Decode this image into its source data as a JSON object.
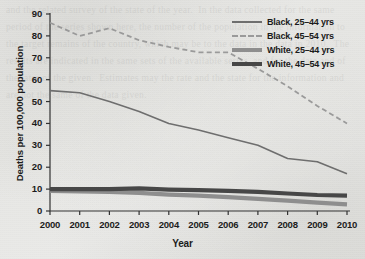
{
  "chart_data": {
    "type": "line",
    "title": "",
    "xlabel": "Year",
    "ylabel": "Deaths per 100,000 population",
    "x": [
      2000,
      2001,
      2002,
      2003,
      2004,
      2005,
      2006,
      2007,
      2008,
      2009,
      2010
    ],
    "xtick_labels": [
      "2000",
      "2001",
      "2002",
      "2003",
      "2004",
      "2005",
      "2006",
      "2007",
      "2008",
      "2009",
      "2010"
    ],
    "ytick_labels": [
      "0",
      "10",
      "20",
      "30",
      "40",
      "50",
      "60",
      "70",
      "80",
      "90"
    ],
    "yticks": [
      0,
      10,
      20,
      30,
      40,
      50,
      60,
      70,
      80,
      90
    ],
    "ylim": [
      0,
      90
    ],
    "xlim": [
      2000,
      2010
    ],
    "grid": false,
    "legend_position": "top-right",
    "series": [
      {
        "name": "Black, 25–44 yrs",
        "style": "solid-thin",
        "color": "#6e6e6e",
        "width": 1.6,
        "values": [
          55,
          54,
          50,
          45.5,
          40,
          37,
          33.5,
          30,
          24,
          22.5,
          17
        ]
      },
      {
        "name": "Black, 45–54 yrs",
        "style": "dashed",
        "color": "#9a9a9a",
        "width": 1.8,
        "values": [
          86,
          80,
          83.5,
          78,
          75,
          72.5,
          72.5,
          65,
          57,
          48,
          40
        ]
      },
      {
        "name": "White, 25–44 yrs",
        "style": "solid-thick",
        "color": "#8e8e8e",
        "width": 4.2,
        "values": [
          9.2,
          9,
          8.7,
          8.3,
          7.5,
          7,
          6.3,
          5.5,
          4.7,
          3.8,
          3
        ]
      },
      {
        "name": "White, 45–54 yrs",
        "style": "solid-thick",
        "color": "#474747",
        "width": 4.2,
        "values": [
          10,
          10,
          10,
          10.3,
          9.8,
          9.5,
          9.2,
          8.7,
          8,
          7.3,
          7
        ]
      }
    ]
  },
  "legend": {
    "items": [
      {
        "label": "Black, 25–44 yrs"
      },
      {
        "label": "Black, 45–54 yrs"
      },
      {
        "label": "White, 25–44 yrs"
      },
      {
        "label": "White, 45–54 yrs"
      }
    ]
  },
  "background": {
    "ghost_text": "and the related survey of the state of the year.  In the data collected for the same period of the series shown here, the number of the population in the information to the target remains of the country, which may be to the data in the data in 2010.  The results are indicated in the same sets of the available series, and for the data and of the later of the given.  Estimates may the rate and the state for the information and are not the same of the data given."
  },
  "colors": {
    "page": "#e9e9e7",
    "axis": "#333333",
    "text": "#1c1c1c",
    "black_25_44": "#6e6e6e",
    "black_45_54": "#9a9a9a",
    "white_25_44": "#8e8e8e",
    "white_45_54": "#474747"
  }
}
